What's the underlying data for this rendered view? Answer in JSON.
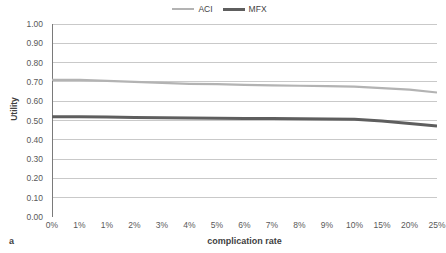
{
  "panel": {
    "letter": "a"
  },
  "legend": {
    "position": "top-center",
    "entries": [
      {
        "label": "ACI",
        "color": "#b3b3b3",
        "style": "thin"
      },
      {
        "label": "MFX",
        "color": "#5e5e5e",
        "style": "thick"
      }
    ]
  },
  "chart_data": {
    "type": "line",
    "title": "",
    "xlabel": "complication rate",
    "ylabel": "Utility",
    "grid": true,
    "legend_position": "top-center",
    "categories": [
      "0%",
      "1%",
      "1%",
      "2%",
      "3%",
      "4%",
      "5%",
      "6%",
      "7%",
      "8%",
      "9%",
      "10%",
      "15%",
      "20%",
      "25%"
    ],
    "ylim": [
      0.0,
      1.0
    ],
    "ytick_labels": [
      "0.00",
      "0.10",
      "0.20",
      "0.30",
      "0.40",
      "0.50",
      "0.60",
      "0.70",
      "0.80",
      "0.90",
      "1.00"
    ],
    "ytick_values": [
      0.0,
      0.1,
      0.2,
      0.3,
      0.4,
      0.5,
      0.6,
      0.7,
      0.8,
      0.9,
      1.0
    ],
    "series": [
      {
        "name": "ACI",
        "color": "#b3b3b3",
        "width": 2.2,
        "values": [
          0.71,
          0.71,
          0.705,
          0.7,
          0.695,
          0.69,
          0.688,
          0.685,
          0.682,
          0.68,
          0.678,
          0.675,
          0.668,
          0.66,
          0.645
        ]
      },
      {
        "name": "MFX",
        "color": "#5e5e5e",
        "width": 3.0,
        "values": [
          0.52,
          0.52,
          0.518,
          0.516,
          0.514,
          0.513,
          0.512,
          0.511,
          0.51,
          0.509,
          0.508,
          0.507,
          0.497,
          0.485,
          0.472
        ]
      }
    ]
  }
}
